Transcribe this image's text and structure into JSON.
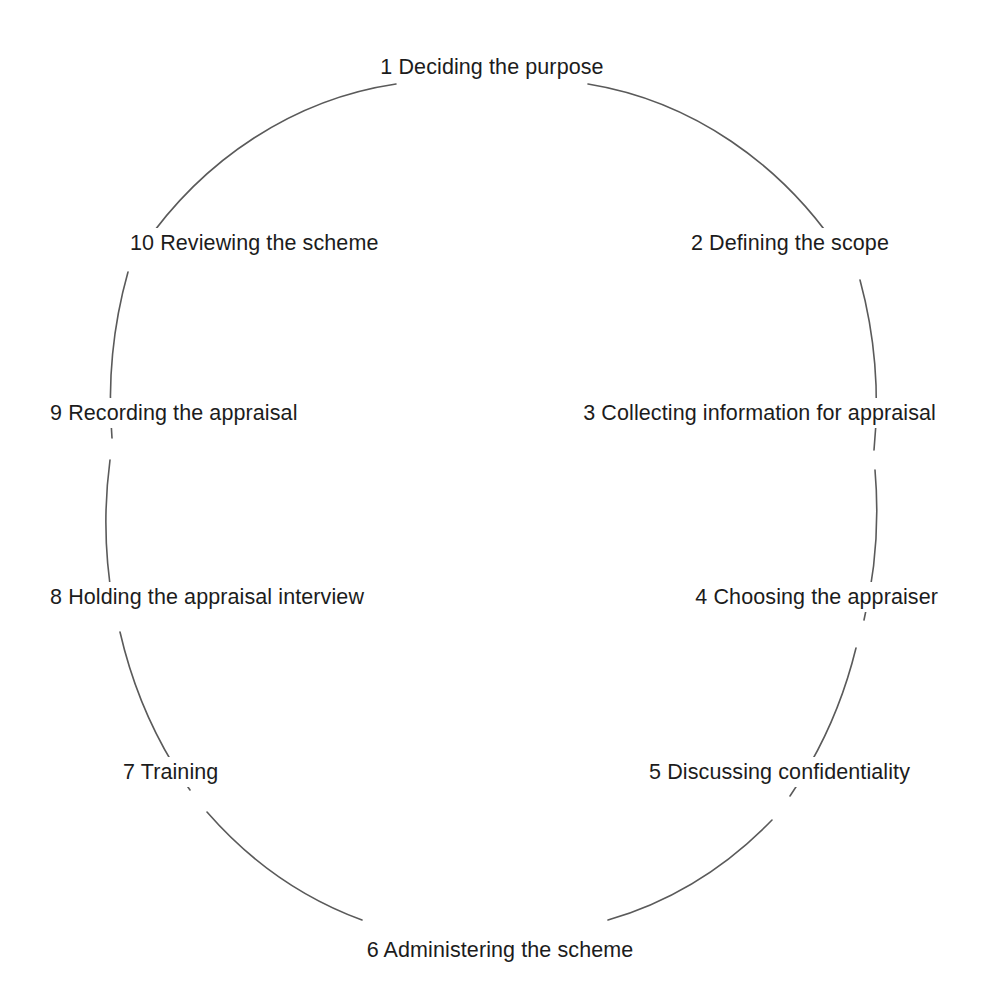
{
  "diagram": {
    "type": "cycle",
    "shape": "ellipse",
    "title": "",
    "stroke_color": "#5a5a5a",
    "text_color": "#1c1c1c",
    "background_color": "#ffffff",
    "geometry": {
      "center_x": 492,
      "center_y": 508,
      "radius_x": 383,
      "radius_y": 427,
      "stroke_width": 1.6
    },
    "steps": [
      {
        "number": "1",
        "text": "Deciding the purpose",
        "label": "1 Deciding the purpose",
        "position": "top-center",
        "x": 492,
        "y": 52,
        "align": "center"
      },
      {
        "number": "2",
        "text": "Defining the scope",
        "label": "2 Defining the scope",
        "position": "upper-right",
        "x": 894,
        "y": 228,
        "align": "right"
      },
      {
        "number": "3",
        "text": "Collecting information for appraisal",
        "label": "3 Collecting information for appraisal",
        "position": "right",
        "x": 941,
        "y": 398,
        "align": "right"
      },
      {
        "number": "4",
        "text": "Choosing the appraiser",
        "label": "4 Choosing the appraiser",
        "position": "lower-right",
        "x": 943,
        "y": 582,
        "align": "right"
      },
      {
        "number": "5",
        "text": "Discussing confidentiality",
        "label": "5 Discussing confidentiality",
        "position": "bottom-right",
        "x": 915,
        "y": 757,
        "align": "right"
      },
      {
        "number": "6",
        "text": "Administering the scheme",
        "label": "6 Administering the scheme",
        "position": "bottom-center",
        "x": 500,
        "y": 935,
        "align": "center"
      },
      {
        "number": "7",
        "text": "Training",
        "label": "7 Training",
        "position": "bottom-left",
        "x": 118,
        "y": 757,
        "align": "left"
      },
      {
        "number": "8",
        "text": "Holding the appraisal interview",
        "label": "8 Holding the appraisal interview",
        "position": "lower-left",
        "x": 45,
        "y": 582,
        "align": "left"
      },
      {
        "number": "9",
        "text": "Recording the appraisal",
        "label": "9 Recording the appraisal",
        "position": "left",
        "x": 45,
        "y": 398,
        "align": "left"
      },
      {
        "number": "10",
        "text": "Reviewing the scheme",
        "label": "10 Reviewing the scheme",
        "position": "upper-left",
        "x": 125,
        "y": 228,
        "align": "left"
      }
    ],
    "arc_segments": [
      {
        "name": "arc-1-to-2",
        "d": "M 588 84 A 383 427 0 0 1 843 256"
      },
      {
        "name": "arc-2-to-3",
        "d": "M 860 280 A 383 427 0 0 1 874 450"
      },
      {
        "name": "arc-3-to-4",
        "d": "M 875 470 A 383 427 0 0 1 864 620"
      },
      {
        "name": "arc-4-to-5",
        "d": "M 856 648 A 383 427 0 0 1 790 796"
      },
      {
        "name": "arc-5-to-6",
        "d": "M 772 820 A 383 427 0 0 1 608 920"
      },
      {
        "name": "arc-6-to-7",
        "d": "M 362 920 A 383 427 0 0 1 207 812"
      },
      {
        "name": "arc-7-to-8",
        "d": "M 190 790 A 383 427 0 0 1 120 632"
      },
      {
        "name": "arc-8-to-9",
        "d": "M 113 604 A 383 427 0 0 1 110 460"
      },
      {
        "name": "arc-9-to-10",
        "d": "M 112 438 A 383 427 0 0 1 128 272"
      },
      {
        "name": "arc-10-to-1",
        "d": "M 142 248 A 383 427 0 0 1 396 84"
      }
    ]
  }
}
